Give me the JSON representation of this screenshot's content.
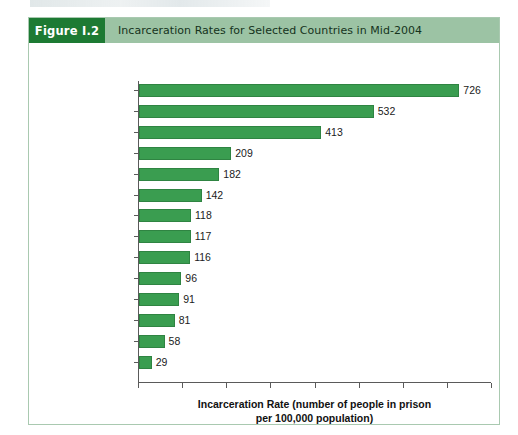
{
  "figure": {
    "number_label": "Figure I.2",
    "title": "Incarceration Rates for Selected Countries in Mid-2004"
  },
  "colors": {
    "figure_number_block": "#1d7a33",
    "header_band": "#9cc3a4",
    "bar_fill": "#3a9d50",
    "bar_stroke": "#2f8442",
    "panel_border": "#a9c9b0",
    "axis": "#5a5a5a"
  },
  "chart_data": {
    "type": "bar",
    "orientation": "horizontal",
    "title": "Incarceration Rates for Selected Countries in Mid-2004",
    "xlabel": "Incarceration Rate (number of people in prison per 100,000 population)",
    "xlabel_line1": "Incarceration Rate (number of people in prison",
    "xlabel_line2": "per 100,000 population)",
    "ylabel": "",
    "categories": [
      "United States",
      "Russia",
      "South Africa",
      "Israel",
      "Mexico",
      "England and Wales",
      "China",
      "Australia",
      "Canada",
      "Germany",
      "France",
      "Sweden",
      "Japan",
      "India"
    ],
    "values": [
      726,
      532,
      413,
      209,
      182,
      142,
      118,
      117,
      116,
      96,
      91,
      81,
      58,
      29
    ],
    "value_labels": [
      "726",
      "532",
      "413",
      "209",
      "182",
      "142",
      "118",
      "117",
      "116",
      "96",
      "91",
      "81",
      "58",
      "29"
    ],
    "xlim": [
      0,
      800
    ],
    "xticks": [
      0,
      100,
      200,
      300,
      400,
      500,
      600,
      700,
      800
    ],
    "xtick_labels": [
      "",
      "",
      "",
      "",
      "",
      "",
      "",
      "",
      ""
    ],
    "grid": false,
    "legend": false
  }
}
